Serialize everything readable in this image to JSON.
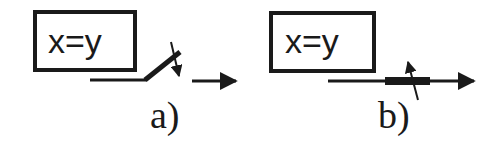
{
  "diagram": {
    "panels": [
      {
        "id": "a",
        "box_text": "x=y",
        "label": "a)",
        "switch_state": "open"
      },
      {
        "id": "b",
        "box_text": "x=y",
        "label": "b)",
        "switch_state": "closed"
      }
    ],
    "colors": {
      "stroke": "#1a1a1a",
      "background": "#ffffff"
    }
  }
}
